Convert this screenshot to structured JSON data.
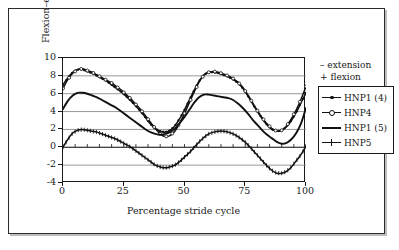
{
  "figure": {
    "border_color": "#2b2b2b",
    "background": "#ffffff"
  },
  "axes": {
    "y_title": "Flexion–extension (°)",
    "x_title": "Percentage stride cycle",
    "y_ticks": [
      "10",
      "8",
      "6",
      "4",
      "2",
      "0",
      "-2",
      "-4"
    ],
    "x_ticks": [
      "0",
      "25",
      "50",
      "75",
      "100"
    ]
  },
  "sign_note": {
    "line1": "– extension",
    "line2": "+ flexion"
  },
  "legend": {
    "items": [
      {
        "label": "HNP1 (4)",
        "marker": "dot"
      },
      {
        "label": "HNP4",
        "marker": "open-circle"
      },
      {
        "label": "HNP1 (5)",
        "marker": "plain-line"
      },
      {
        "label": "HNP5",
        "marker": "plus"
      }
    ]
  },
  "chart_data": {
    "type": "line",
    "title": "",
    "subtitle": "",
    "xlabel": "Percentage stride cycle",
    "ylabel": "Flexion–extension (°)",
    "xlim": [
      0,
      100
    ],
    "ylim": [
      -4,
      10
    ],
    "y_tick_values": [
      10,
      8,
      6,
      4,
      2,
      0,
      -2,
      -4
    ],
    "x_tick_values": [
      0,
      25,
      50,
      75,
      100
    ],
    "grid": "horizontal",
    "legend_position": "right",
    "annotations": [
      "– extension",
      "+ flexion"
    ],
    "x": [
      0,
      2,
      4,
      6,
      8,
      10,
      12,
      14,
      16,
      18,
      20,
      22,
      24,
      26,
      28,
      30,
      32,
      34,
      36,
      38,
      40,
      42,
      44,
      46,
      48,
      50,
      52,
      54,
      56,
      58,
      60,
      62,
      64,
      66,
      68,
      70,
      72,
      74,
      76,
      78,
      80,
      82,
      84,
      86,
      88,
      90,
      92,
      94,
      96,
      98,
      100
    ],
    "series": [
      {
        "name": "HNP1 (4)",
        "marker": "dot",
        "values": [
          7.0,
          7.8,
          8.4,
          8.7,
          8.7,
          8.5,
          8.3,
          8.0,
          7.7,
          7.4,
          7.0,
          6.6,
          6.2,
          5.7,
          5.2,
          4.6,
          4.0,
          3.3,
          2.6,
          2.1,
          1.8,
          1.7,
          1.9,
          2.4,
          3.2,
          4.2,
          5.3,
          6.4,
          7.4,
          8.1,
          8.4,
          8.4,
          8.3,
          8.1,
          7.9,
          7.6,
          7.2,
          6.6,
          5.8,
          4.9,
          4.0,
          3.2,
          2.5,
          2.0,
          1.8,
          1.9,
          2.3,
          3.0,
          3.9,
          5.0,
          6.1
        ]
      },
      {
        "name": "HNP4",
        "marker": "open-circle",
        "values": [
          6.6,
          7.6,
          8.3,
          8.7,
          8.8,
          8.6,
          8.4,
          8.1,
          7.8,
          7.5,
          7.2,
          6.8,
          6.4,
          5.9,
          5.4,
          4.8,
          4.2,
          3.5,
          2.8,
          2.1,
          1.5,
          1.2,
          1.3,
          1.8,
          2.7,
          3.8,
          5.0,
          6.2,
          7.3,
          8.1,
          8.4,
          8.5,
          8.4,
          8.2,
          8.0,
          7.7,
          7.3,
          6.7,
          5.9,
          5.0,
          4.1,
          3.3,
          2.6,
          2.1,
          1.8,
          1.9,
          2.4,
          3.2,
          4.2,
          5.4,
          6.8
        ]
      },
      {
        "name": "HNP1 (5)",
        "marker": "plain-line",
        "values": [
          4.3,
          5.2,
          5.8,
          6.1,
          6.1,
          6.0,
          5.8,
          5.6,
          5.3,
          5.0,
          4.7,
          4.4,
          4.0,
          3.6,
          3.2,
          2.8,
          2.4,
          2.0,
          1.7,
          1.5,
          1.4,
          1.5,
          1.7,
          2.1,
          2.7,
          3.4,
          4.2,
          5.0,
          5.6,
          5.9,
          5.9,
          5.8,
          5.7,
          5.6,
          5.5,
          5.3,
          4.9,
          4.4,
          3.8,
          3.1,
          2.5,
          1.9,
          1.4,
          1.0,
          0.6,
          0.4,
          0.5,
          0.9,
          1.6,
          2.7,
          4.4
        ]
      },
      {
        "name": "HNP5",
        "marker": "plus",
        "values": [
          0.0,
          0.9,
          1.6,
          1.9,
          2.0,
          1.9,
          1.8,
          1.7,
          1.5,
          1.3,
          1.1,
          0.9,
          0.6,
          0.3,
          0.0,
          -0.4,
          -0.8,
          -1.2,
          -1.6,
          -2.0,
          -2.2,
          -2.3,
          -2.2,
          -2.0,
          -1.6,
          -1.1,
          -0.6,
          0.0,
          0.6,
          1.1,
          1.5,
          1.7,
          1.8,
          1.8,
          1.7,
          1.5,
          1.2,
          0.8,
          0.3,
          -0.3,
          -0.9,
          -1.5,
          -2.1,
          -2.6,
          -2.9,
          -2.9,
          -2.7,
          -2.2,
          -1.5,
          -0.8,
          0.1
        ]
      }
    ]
  }
}
